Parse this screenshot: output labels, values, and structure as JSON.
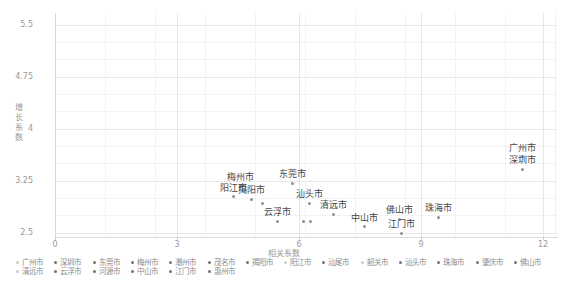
{
  "chart_data": {
    "type": "scatter",
    "title": "",
    "xlabel": "相关系数",
    "ylabel": "增长系数",
    "xlim": [
      0,
      12.35
    ],
    "ylim": [
      2.44,
      5.67
    ],
    "xticks": [
      "0",
      "3",
      "6",
      "9",
      "12"
    ],
    "xtick_values": [
      0,
      3,
      6,
      9,
      12
    ],
    "yticks": [
      "2.5",
      "3.25",
      "4",
      "4.75",
      "5.5"
    ],
    "ytick_values": [
      2.5,
      3.25,
      4,
      4.75,
      5.5
    ],
    "grid": true,
    "legend_position": "bottom",
    "points": [
      {
        "city": "广州市",
        "x": 11.5,
        "y": 3.6,
        "labeled": true
      },
      {
        "city": "深圳市",
        "x": 11.5,
        "y": 3.42,
        "labeled": true
      },
      {
        "city": "梅州市",
        "x": 4.55,
        "y": 3.18,
        "labeled": true
      },
      {
        "city": "东莞市",
        "x": 5.85,
        "y": 3.22,
        "labeled": true
      },
      {
        "city": "阳江市",
        "x": 4.4,
        "y": 3.02,
        "labeled": true
      },
      {
        "city": "揭阳市",
        "x": 4.82,
        "y": 2.99,
        "labeled": true
      },
      {
        "city": "汕头市",
        "x": 6.25,
        "y": 2.93,
        "labeled": true
      },
      {
        "city": "云浮市",
        "x": 5.48,
        "y": 2.67,
        "labeled": true
      },
      {
        "city": "清远市",
        "x": 6.86,
        "y": 2.77,
        "labeled": true
      },
      {
        "city": "中山市",
        "x": 7.6,
        "y": 2.59,
        "labeled": true
      },
      {
        "city": "佛山市",
        "x": 8.46,
        "y": 2.7,
        "labeled": true
      },
      {
        "city": "江门市",
        "x": 8.51,
        "y": 2.5,
        "labeled": true
      },
      {
        "city": "珠海市",
        "x": 9.42,
        "y": 2.73,
        "labeled": true
      },
      {
        "city": "",
        "x": 5.09,
        "y": 2.93,
        "labeled": false
      },
      {
        "city": "",
        "x": 6.1,
        "y": 2.66,
        "labeled": false
      },
      {
        "city": "",
        "x": 6.29,
        "y": 2.66,
        "labeled": false
      }
    ],
    "legend_rows": [
      [
        {
          "label": "广州市",
          "muted": true
        },
        {
          "label": "深圳市",
          "muted": false
        },
        {
          "label": "东莞市",
          "muted": false
        },
        {
          "label": "梅州市",
          "muted": false
        },
        {
          "label": "潮州市",
          "muted": false
        },
        {
          "label": "茂名市",
          "muted": false
        },
        {
          "label": "揭阳市",
          "muted": false
        },
        {
          "label": "阳江市",
          "muted": true
        },
        {
          "label": "汕尾市",
          "muted": false
        },
        {
          "label": "韶关市",
          "muted": true
        },
        {
          "label": "汕头市",
          "muted": false
        },
        {
          "label": "珠海市",
          "muted": false
        },
        {
          "label": "肇庆市",
          "muted": false
        },
        {
          "label": "佛山市",
          "muted": false
        }
      ],
      [
        {
          "label": "清远市",
          "muted": true
        },
        {
          "label": "云浮市",
          "muted": false
        },
        {
          "label": "河源市",
          "muted": false
        },
        {
          "label": "中山市",
          "muted": false
        },
        {
          "label": "江门市",
          "muted": false
        },
        {
          "label": "惠州市",
          "muted": false
        }
      ]
    ]
  },
  "colors": {
    "background": "#ffffff",
    "point": "#8f8f8f",
    "point_label": "#454545",
    "axis_line": "#d9d9d9",
    "grid_major": "#e7e7e7",
    "grid_minor": "#f3f3f3",
    "tick_label": "#999999",
    "axis_title": "#999999",
    "legend_text": "#8c8c8c",
    "legend_marker": "#737373",
    "legend_marker_muted": "#cccccc"
  }
}
